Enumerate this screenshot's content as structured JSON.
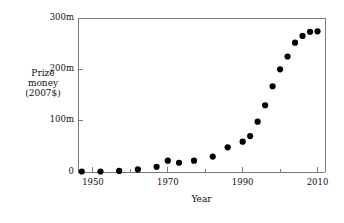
{
  "chart_data": {
    "type": "scatter",
    "title": "",
    "xlabel": "Year",
    "ylabel": "Prize money (2007$)",
    "ylabel_lines": [
      "Prize",
      "money",
      "(2007$)"
    ],
    "xlim": [
      1946,
      2012
    ],
    "ylim": [
      0,
      300
    ],
    "y_unit": "m",
    "grid": false,
    "legend": null,
    "xticks": [
      1950,
      1970,
      1990,
      2010
    ],
    "xtick_labels": [
      "1950",
      "1970",
      "1990",
      "2010"
    ],
    "xminorticks": [
      1960,
      1980,
      2000
    ],
    "yticks": [
      0,
      100,
      200,
      300
    ],
    "ytick_labels": [
      "0",
      "100m",
      "200m",
      "300m"
    ],
    "marker": "filled-circle",
    "marker_color": "#000000",
    "marker_size_px": 4.2,
    "points": [
      {
        "x": 1947,
        "y": 1
      },
      {
        "x": 1952,
        "y": 1
      },
      {
        "x": 1957,
        "y": 2
      },
      {
        "x": 1962,
        "y": 5
      },
      {
        "x": 1967,
        "y": 10
      },
      {
        "x": 1970,
        "y": 22
      },
      {
        "x": 1973,
        "y": 18
      },
      {
        "x": 1977,
        "y": 22
      },
      {
        "x": 1982,
        "y": 30
      },
      {
        "x": 1986,
        "y": 48
      },
      {
        "x": 1990,
        "y": 59
      },
      {
        "x": 1992,
        "y": 70
      },
      {
        "x": 1994,
        "y": 98
      },
      {
        "x": 1996,
        "y": 130
      },
      {
        "x": 1998,
        "y": 167
      },
      {
        "x": 2000,
        "y": 200
      },
      {
        "x": 2002,
        "y": 225
      },
      {
        "x": 2004,
        "y": 252
      },
      {
        "x": 2006,
        "y": 265
      },
      {
        "x": 2008,
        "y": 273
      },
      {
        "x": 2010,
        "y": 274
      }
    ]
  },
  "axes_geometry": {
    "left_px": 78,
    "right_px": 325,
    "top_px": 18,
    "bottom_px": 172
  },
  "colors": {
    "axis": "#7a7a7a",
    "marker": "#000000",
    "background": "#ffffff",
    "text": "#111111"
  }
}
